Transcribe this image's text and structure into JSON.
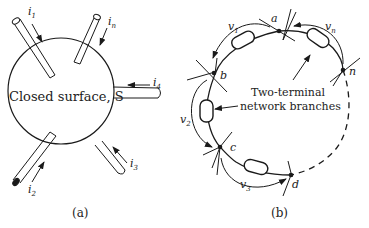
{
  "figure_a": {
    "caption": "(a)",
    "surface_label": "Closed surface, S",
    "currents": [
      {
        "name": "i1",
        "base": "i",
        "sub": "1"
      },
      {
        "name": "in",
        "base": "i",
        "sub": "n"
      },
      {
        "name": "i4",
        "base": "i",
        "sub": "4"
      },
      {
        "name": "i3",
        "base": "i",
        "sub": "3"
      },
      {
        "name": "i2",
        "base": "i",
        "sub": "2"
      }
    ]
  },
  "figure_b": {
    "caption": "(b)",
    "branch_label_line1": "Two-terminal",
    "branch_label_line2": "network branches",
    "nodes": [
      "a",
      "b",
      "c",
      "d",
      "n"
    ],
    "voltages": [
      {
        "name": "v1",
        "base": "v",
        "sub": "1"
      },
      {
        "name": "v2",
        "base": "v",
        "sub": "2"
      },
      {
        "name": "v3",
        "base": "v",
        "sub": "3"
      },
      {
        "name": "vn",
        "base": "v",
        "sub": "n"
      }
    ]
  },
  "colors": {
    "ink": "#1a1a1a",
    "background": "#ffffff"
  }
}
